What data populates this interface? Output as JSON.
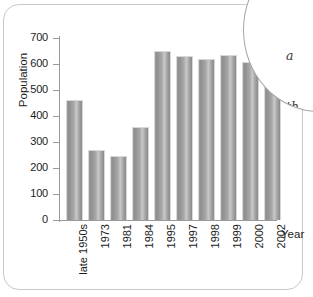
{
  "chart_data": {
    "type": "bar",
    "title": "",
    "xlabel": "Year",
    "ylabel": "Population",
    "categories": [
      "late 1950s",
      "1973",
      "1981",
      "1984",
      "1995",
      "1997",
      "1998",
      "1999",
      "2000",
      "2002"
    ],
    "values": [
      460,
      270,
      247,
      358,
      650,
      632,
      618,
      635,
      607,
      656
    ],
    "ylim": [
      0,
      700
    ],
    "yticks": [
      0,
      100,
      200,
      300,
      400,
      500,
      600,
      700
    ],
    "ytick_labels": [
      "0",
      "100",
      "200",
      "300",
      "400",
      "500",
      "600",
      "700"
    ],
    "grid": false,
    "legend": false,
    "bar_color": "#a0a0a0"
  },
  "annotation": {
    "lines": [
      "a",
      "th",
      "No",
      "r"
    ]
  },
  "colors": {
    "axis": "#9a9a9a",
    "text": "#1b1b1b",
    "card_border": "#c9c9c9",
    "bubble_border": "#a6a6a6"
  }
}
